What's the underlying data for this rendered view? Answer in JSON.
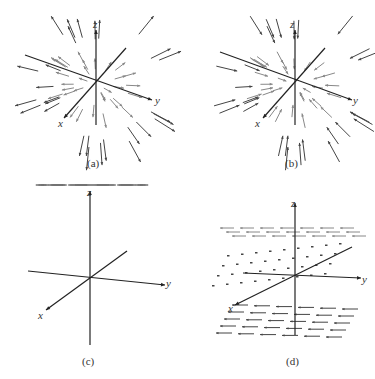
{
  "figure": {
    "panels": [
      {
        "id": "a",
        "caption": "(a)",
        "axes": {
          "x": "x",
          "y": "y",
          "z": "z"
        },
        "field": "radial-outward"
      },
      {
        "id": "b",
        "caption": "(b)",
        "axes": {
          "x": "x",
          "y": "y",
          "z": "z"
        },
        "field": "radial-inward"
      },
      {
        "id": "c",
        "caption": "(c)",
        "axes": {
          "x": "x",
          "y": "y",
          "z": "z"
        },
        "field": "rotational-about-z"
      },
      {
        "id": "d",
        "caption": "(d)",
        "axes": {
          "x": "x",
          "y": "y",
          "z": "z"
        },
        "field": "horizontal-layers-varying-with-z"
      }
    ]
  },
  "colors": {
    "arrow_dark": "#444444",
    "arrow_light": "#888888",
    "axis": "#222222",
    "text": "#333333"
  }
}
